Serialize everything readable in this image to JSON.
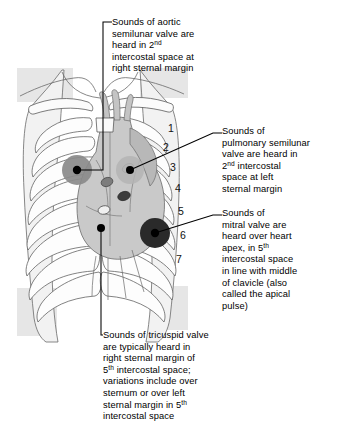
{
  "figure": {
    "body_fill": "#e4e4e4",
    "heart_fill": "#c9c9c9",
    "line_color": "#4a4a4a",
    "marker_color": "#000000"
  },
  "annotations": {
    "aortic": {
      "label": "aortic-valve-annotation",
      "lines": [
        "Sounds of aortic",
        "semilunar valve are",
        "heard in 2|nd|",
        "intercostal space at",
        "right sternal margin"
      ]
    },
    "pulmonary": {
      "label": "pulmonary-valve-annotation",
      "lines": [
        "Sounds of",
        "pulmonary semilunar",
        "valve are heard in",
        "2|nd| intercostal",
        "space at left",
        "sternal margin"
      ]
    },
    "mitral": {
      "label": "mitral-valve-annotation",
      "lines": [
        "Sounds of",
        "mitral valve are",
        "heard over heart",
        "apex, in 5|th|",
        "intercostal space",
        "in line with middle",
        "of clavicle (also",
        "called the apical",
        "pulse)"
      ]
    },
    "tricuspid": {
      "label": "tricuspid-valve-annotation",
      "lines": [
        "Sounds of tricuspid valve",
        "are typically heard in",
        "right sternal margin of",
        "5|th| intercostal space;",
        "variations include over",
        "sternum or over left",
        "sternal margin in 5|th|",
        "intercostal space"
      ]
    }
  },
  "rib_numbers": [
    {
      "n": "1",
      "x": 168,
      "y": 132
    },
    {
      "n": "2",
      "x": 163,
      "y": 151
    },
    {
      "n": "3",
      "x": 170,
      "y": 171
    },
    {
      "n": "4",
      "x": 175,
      "y": 192
    },
    {
      "n": "5",
      "x": 178,
      "y": 215
    },
    {
      "n": "6",
      "x": 180,
      "y": 239
    },
    {
      "n": "7",
      "x": 176,
      "y": 263
    }
  ],
  "markers": {
    "aortic": {
      "name": "aortic-auscultation-marker",
      "cx": 77,
      "cy": 170,
      "halo_r": 15,
      "dot_r": 4.2,
      "halo": "#8a8a8a"
    },
    "pulmonary": {
      "name": "pulmonary-auscultation-marker",
      "cx": 130,
      "cy": 170,
      "halo_r": 14,
      "dot_r": 4.0,
      "halo": "#b4b4b4"
    },
    "tricuspid": {
      "name": "tricuspid-auscultation-marker",
      "cx": 101,
      "cy": 228,
      "halo_r": 0,
      "dot_r": 4.0,
      "halo": "none"
    },
    "mitral": {
      "name": "mitral-auscultation-marker",
      "cx": 155,
      "cy": 233,
      "halo_r": 15,
      "dot_r": 4.2,
      "halo": "#2a2a2a"
    }
  }
}
